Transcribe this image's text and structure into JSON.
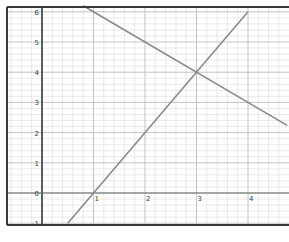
{
  "chart_data": {
    "type": "line",
    "title": "",
    "xlabel": "",
    "ylabel": "",
    "xlim": [
      -0.68,
      4.76
    ],
    "ylim": [
      -1,
      6.2
    ],
    "grid": true,
    "minor_divisions": 5,
    "x_ticks": [
      "1",
      "2",
      "3",
      "4"
    ],
    "y_ticks": [
      "-1",
      "0",
      "1",
      "2",
      "3",
      "4",
      "5",
      "6"
    ],
    "series": [
      {
        "name": "rising line",
        "equation": "y = 2x - 2",
        "x": [
          0.5,
          4.0
        ],
        "y": [
          -1,
          6
        ],
        "color": "#8a8a8a"
      },
      {
        "name": "falling line",
        "equation": "y = -x + 7",
        "x": [
          0.8,
          4.76
        ],
        "y": [
          6.2,
          2.24
        ],
        "color": "#8a8a8a"
      }
    ],
    "annotations": [
      {
        "label": "intersection",
        "x": 3,
        "y": 4
      }
    ]
  },
  "colors": {
    "frame": "#3a3a3a",
    "axis": "#6a6a6a",
    "major_grid": "#c4c4c4",
    "minor_grid": "#e4e4e4",
    "series": "#8a8a8a"
  }
}
